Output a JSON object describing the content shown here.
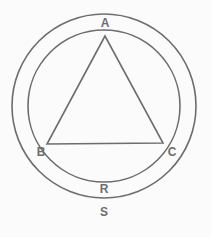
{
  "figure": {
    "name": "circumscribed-equilateral-triangle-in-annulus",
    "canvas": {
      "width": 211,
      "height": 237,
      "background": "#fbfbfb"
    },
    "stroke": {
      "color": "#6d6d6d",
      "width": 1.6
    },
    "label_color": "#6d6d6d",
    "shapes": {
      "outer_circle": {
        "cx": 104,
        "cy": 106,
        "r": 92
      },
      "inner_circle": {
        "cx": 104,
        "cy": 106,
        "r": 76
      },
      "triangle": {
        "points": "105,36 47,144 163,143",
        "vertices": [
          {
            "id": "A",
            "x": 105,
            "y": 36
          },
          {
            "id": "B",
            "x": 47,
            "y": 144
          },
          {
            "id": "C",
            "x": 163,
            "y": 143
          }
        ]
      }
    },
    "labels": [
      {
        "id": "A",
        "text": "A",
        "x": 105,
        "y": 23
      },
      {
        "id": "B",
        "text": "B",
        "x": 41,
        "y": 152
      },
      {
        "id": "C",
        "text": "C",
        "x": 172,
        "y": 152
      },
      {
        "id": "R",
        "text": "R",
        "x": 104,
        "y": 189
      },
      {
        "id": "S",
        "text": "S",
        "x": 104,
        "y": 212
      }
    ]
  }
}
